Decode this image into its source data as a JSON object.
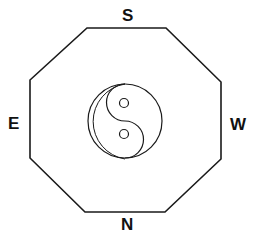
{
  "diagram": {
    "shape": "octagon",
    "center_symbol": "yin-yang",
    "directions": {
      "top": "S",
      "bottom": "N",
      "left": "E",
      "right": "W"
    },
    "colors": {
      "stroke": "#1a1a1a",
      "background": "#ffffff"
    }
  }
}
